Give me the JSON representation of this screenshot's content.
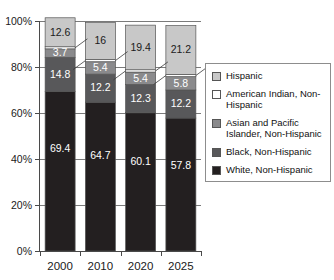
{
  "chart_data": {
    "type": "bar",
    "subtype": "stacked-percentage",
    "title": "",
    "xlabel": "",
    "ylabel": "",
    "ylim": [
      0,
      100
    ],
    "yticks": [
      "0%",
      "20%",
      "40%",
      "60%",
      "80%",
      "100%"
    ],
    "ytick_values": [
      0,
      20,
      40,
      60,
      80,
      100
    ],
    "grid": true,
    "legend_position": "right",
    "categories": [
      "2000",
      "2010",
      "2020",
      "2025"
    ],
    "series": [
      {
        "name": "White, Non-Hispanic",
        "color": "#231f20",
        "label_color": "light",
        "values": [
          69.4,
          64.7,
          60.1,
          57.8
        ],
        "labels": [
          "69.4",
          "64.7",
          "60.1",
          "57.8"
        ]
      },
      {
        "name": "Black, Non-Hispanic",
        "color": "#58585a",
        "label_color": "light",
        "values": [
          14.8,
          12.2,
          12.3,
          12.2
        ],
        "labels": [
          "14.8",
          "12.2",
          "12.3",
          "12.2"
        ]
      },
      {
        "name": "Asian and Pacific Islander, Non-Hispanic",
        "color": "#8a8a8c",
        "label_color": "light",
        "values": [
          3.7,
          5.4,
          5.4,
          5.8
        ],
        "labels": [
          "3.7",
          "5.4",
          "5.4",
          "5.8"
        ]
      },
      {
        "name": "American Indian, Non-Hispanic",
        "color": "#ffffff",
        "label_color": "dark",
        "values": [
          0.9,
          1.0,
          1.0,
          1.0
        ],
        "labels": [
          "",
          "",
          "",
          ""
        ]
      },
      {
        "name": "Hispanic",
        "color": "#c8c8c8",
        "label_color": "dark",
        "values": [
          12.6,
          16.0,
          19.4,
          21.2
        ],
        "labels": [
          "12.6",
          "16",
          "19.4",
          "21.2"
        ]
      }
    ]
  },
  "legend": {
    "items": [
      {
        "label": "Hispanic",
        "color": "#c8c8c8"
      },
      {
        "label": "American Indian, Non-Hispanic",
        "color": "#ffffff"
      },
      {
        "label": "Asian and Pacific Islander, Non-Hispanic",
        "color": "#8a8a8c"
      },
      {
        "label": "Black, Non-Hispanic",
        "color": "#58585a"
      },
      {
        "label": "White, Non-Hispanic",
        "color": "#231f20"
      }
    ]
  },
  "axis": {
    "y_labels": [
      "100%",
      "80%",
      "60%",
      "40%",
      "20%",
      "0%"
    ],
    "x_labels": [
      "2000",
      "2010",
      "2020",
      "2025"
    ]
  }
}
